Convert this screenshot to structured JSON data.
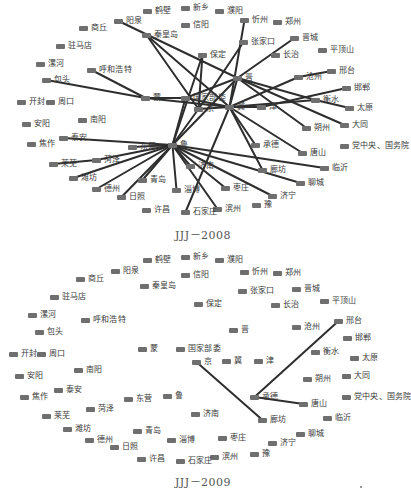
{
  "figures": [
    {
      "id": "2008",
      "caption": "JJJ－2008",
      "offset_y": 0,
      "nodes": [
        {
          "label": "鹤壁",
          "x": 143,
          "y": 11
        },
        {
          "label": "新乡",
          "x": 181,
          "y": 8
        },
        {
          "label": "濮阳",
          "x": 215,
          "y": 11
        },
        {
          "label": "忻州",
          "x": 240,
          "y": 20
        },
        {
          "label": "郑州",
          "x": 273,
          "y": 22
        },
        {
          "label": "阳泉",
          "x": 114,
          "y": 21
        },
        {
          "label": "信阳",
          "x": 181,
          "y": 25
        },
        {
          "label": "商丘",
          "x": 79,
          "y": 28
        },
        {
          "label": "秦皇岛",
          "x": 142,
          "y": 35
        },
        {
          "label": "张家口",
          "x": 239,
          "y": 42
        },
        {
          "label": "晋城",
          "x": 290,
          "y": 38
        },
        {
          "label": "驻马店",
          "x": 56,
          "y": 46
        },
        {
          "label": "保定",
          "x": 198,
          "y": 55
        },
        {
          "label": "长治",
          "x": 271,
          "y": 55
        },
        {
          "label": "平顶山",
          "x": 318,
          "y": 50
        },
        {
          "label": "漯河",
          "x": 36,
          "y": 64
        },
        {
          "label": "呼和浩特",
          "x": 87,
          "y": 70
        },
        {
          "label": "邢台",
          "x": 327,
          "y": 71
        },
        {
          "label": "晋",
          "x": 233,
          "y": 78
        },
        {
          "label": "沧州",
          "x": 294,
          "y": 77
        },
        {
          "label": "包头",
          "x": 42,
          "y": 80
        },
        {
          "label": "邯郸",
          "x": 342,
          "y": 88
        },
        {
          "label": "蒙",
          "x": 141,
          "y": 98
        },
        {
          "label": "国家部委",
          "x": 181,
          "y": 98
        },
        {
          "label": "衡水",
          "x": 311,
          "y": 100
        },
        {
          "label": "开封",
          "x": 17,
          "y": 102
        },
        {
          "label": "周口",
          "x": 46,
          "y": 102
        },
        {
          "label": "冀",
          "x": 225,
          "y": 107
        },
        {
          "label": "津",
          "x": 257,
          "y": 107
        },
        {
          "label": "太原",
          "x": 345,
          "y": 108
        },
        {
          "label": "京",
          "x": 194,
          "y": 109
        },
        {
          "label": "南阳",
          "x": 78,
          "y": 120
        },
        {
          "label": "安阳",
          "x": 22,
          "y": 124
        },
        {
          "label": "大同",
          "x": 340,
          "y": 125
        },
        {
          "label": "朔州",
          "x": 302,
          "y": 128
        },
        {
          "label": "泰安",
          "x": 59,
          "y": 138
        },
        {
          "label": "焦作",
          "x": 27,
          "y": 144
        },
        {
          "label": "鲁",
          "x": 168,
          "y": 145
        },
        {
          "label": "承德",
          "x": 251,
          "y": 145
        },
        {
          "label": "党中央、国务院",
          "x": 340,
          "y": 146
        },
        {
          "label": "东营",
          "x": 128,
          "y": 147
        },
        {
          "label": "唐山",
          "x": 298,
          "y": 153
        },
        {
          "label": "菏泽",
          "x": 92,
          "y": 160
        },
        {
          "label": "莱芜",
          "x": 49,
          "y": 164
        },
        {
          "label": "济南",
          "x": 186,
          "y": 166
        },
        {
          "label": "临沂",
          "x": 320,
          "y": 168
        },
        {
          "label": "廊坊",
          "x": 258,
          "y": 170
        },
        {
          "label": "潍坊",
          "x": 69,
          "y": 178
        },
        {
          "label": "青岛",
          "x": 138,
          "y": 180
        },
        {
          "label": "聊城",
          "x": 296,
          "y": 183
        },
        {
          "label": "枣庄",
          "x": 221,
          "y": 188
        },
        {
          "label": "德州",
          "x": 92,
          "y": 189
        },
        {
          "label": "淄博",
          "x": 172,
          "y": 190
        },
        {
          "label": "济宁",
          "x": 268,
          "y": 196
        },
        {
          "label": "日照",
          "x": 117,
          "y": 197
        },
        {
          "label": "豫",
          "x": 252,
          "y": 205
        },
        {
          "label": "滨州",
          "x": 213,
          "y": 209
        },
        {
          "label": "许昌",
          "x": 142,
          "y": 210
        },
        {
          "label": "石家庄",
          "x": 181,
          "y": 212
        }
      ],
      "edges": [
        [
          "阳泉",
          "晋"
        ],
        [
          "秦皇岛",
          "冀"
        ],
        [
          "秦皇岛",
          "京"
        ],
        [
          "呼和浩特",
          "蒙"
        ],
        [
          "包头",
          "蒙"
        ],
        [
          "蒙",
          "国家部委"
        ],
        [
          "蒙",
          "冀"
        ],
        [
          "忻州",
          "冀"
        ],
        [
          "张家口",
          "京"
        ],
        [
          "晋城",
          "晋"
        ],
        [
          "保定",
          "鲁"
        ],
        [
          "保定",
          "京"
        ],
        [
          "晋",
          "国家部委"
        ],
        [
          "晋",
          "冀"
        ],
        [
          "晋",
          "衡水"
        ],
        [
          "晋",
          "朔州"
        ],
        [
          "晋",
          "大同"
        ],
        [
          "晋",
          "鲁"
        ],
        [
          "沧州",
          "冀"
        ],
        [
          "邢台",
          "沧州"
        ],
        [
          "邯郸",
          "津"
        ],
        [
          "衡水",
          "太原"
        ],
        [
          "衡水",
          "冀"
        ],
        [
          "国家部委",
          "鲁"
        ],
        [
          "国家部委",
          "冀"
        ],
        [
          "京",
          "冀"
        ],
        [
          "京",
          "鲁"
        ],
        [
          "冀",
          "津"
        ],
        [
          "冀",
          "承德"
        ],
        [
          "冀",
          "唐山"
        ],
        [
          "冀",
          "廊坊"
        ],
        [
          "冀",
          "石家庄"
        ],
        [
          "泰安",
          "鲁"
        ],
        [
          "东营",
          "鲁"
        ],
        [
          "菏泽",
          "鲁"
        ],
        [
          "莱芜",
          "菏泽"
        ],
        [
          "潍坊",
          "鲁"
        ],
        [
          "德州",
          "鲁"
        ],
        [
          "日照",
          "鲁"
        ],
        [
          "青岛",
          "鲁"
        ],
        [
          "鲁",
          "淄博"
        ],
        [
          "鲁",
          "济南"
        ],
        [
          "鲁",
          "枣庄"
        ],
        [
          "鲁",
          "滨州"
        ],
        [
          "鲁",
          "济宁"
        ],
        [
          "鲁",
          "聊城"
        ],
        [
          "鲁",
          "临沂"
        ]
      ]
    },
    {
      "id": "2009",
      "caption": "JJJ－2009",
      "offset_y": 249,
      "nodes": [
        {
          "label": "鹤壁",
          "x": 143,
          "y": 11
        },
        {
          "label": "新乡",
          "x": 181,
          "y": 8
        },
        {
          "label": "濮阳",
          "x": 215,
          "y": 11
        },
        {
          "label": "忻州",
          "x": 240,
          "y": 23
        },
        {
          "label": "郑州",
          "x": 273,
          "y": 24
        },
        {
          "label": "阳泉",
          "x": 111,
          "y": 22
        },
        {
          "label": "信阳",
          "x": 181,
          "y": 26
        },
        {
          "label": "商丘",
          "x": 76,
          "y": 30
        },
        {
          "label": "秦皇岛",
          "x": 140,
          "y": 37
        },
        {
          "label": "张家口",
          "x": 238,
          "y": 42
        },
        {
          "label": "晋城",
          "x": 292,
          "y": 40
        },
        {
          "label": "驻马店",
          "x": 50,
          "y": 48
        },
        {
          "label": "保定",
          "x": 194,
          "y": 55
        },
        {
          "label": "长治",
          "x": 271,
          "y": 56
        },
        {
          "label": "平顶山",
          "x": 320,
          "y": 52
        },
        {
          "label": "漯河",
          "x": 28,
          "y": 66
        },
        {
          "label": "呼和浩特",
          "x": 81,
          "y": 71
        },
        {
          "label": "邢台",
          "x": 334,
          "y": 72
        },
        {
          "label": "晋",
          "x": 229,
          "y": 81
        },
        {
          "label": "沧州",
          "x": 292,
          "y": 78
        },
        {
          "label": "包头",
          "x": 35,
          "y": 83
        },
        {
          "label": "邯郸",
          "x": 343,
          "y": 89
        },
        {
          "label": "蒙",
          "x": 138,
          "y": 100
        },
        {
          "label": "国家部委",
          "x": 176,
          "y": 100
        },
        {
          "label": "衡水",
          "x": 311,
          "y": 103
        },
        {
          "label": "开封",
          "x": 9,
          "y": 105
        },
        {
          "label": "周口",
          "x": 37,
          "y": 105
        },
        {
          "label": "京",
          "x": 192,
          "y": 113
        },
        {
          "label": "冀",
          "x": 222,
          "y": 112
        },
        {
          "label": "津",
          "x": 254,
          "y": 112
        },
        {
          "label": "太原",
          "x": 350,
          "y": 109
        },
        {
          "label": "南阳",
          "x": 74,
          "y": 121
        },
        {
          "label": "安阳",
          "x": 15,
          "y": 127
        },
        {
          "label": "大同",
          "x": 342,
          "y": 127
        },
        {
          "label": "朔州",
          "x": 303,
          "y": 130
        },
        {
          "label": "泰安",
          "x": 54,
          "y": 141
        },
        {
          "label": "焦作",
          "x": 20,
          "y": 148
        },
        {
          "label": "鲁",
          "x": 163,
          "y": 147
        },
        {
          "label": "承德",
          "x": 250,
          "y": 148
        },
        {
          "label": "党中央、国务院",
          "x": 342,
          "y": 148
        },
        {
          "label": "东营",
          "x": 124,
          "y": 150
        },
        {
          "label": "唐山",
          "x": 299,
          "y": 155
        },
        {
          "label": "菏泽",
          "x": 86,
          "y": 160
        },
        {
          "label": "莱芜",
          "x": 42,
          "y": 167
        },
        {
          "label": "济南",
          "x": 191,
          "y": 165
        },
        {
          "label": "临沂",
          "x": 323,
          "y": 169
        },
        {
          "label": "廊坊",
          "x": 258,
          "y": 171
        },
        {
          "label": "潍坊",
          "x": 63,
          "y": 180
        },
        {
          "label": "青岛",
          "x": 133,
          "y": 182
        },
        {
          "label": "聊城",
          "x": 296,
          "y": 185
        },
        {
          "label": "枣庄",
          "x": 218,
          "y": 189
        },
        {
          "label": "德州",
          "x": 85,
          "y": 191
        },
        {
          "label": "淄博",
          "x": 167,
          "y": 191
        },
        {
          "label": "济宁",
          "x": 268,
          "y": 194
        },
        {
          "label": "日照",
          "x": 110,
          "y": 198
        },
        {
          "label": "豫",
          "x": 250,
          "y": 205
        },
        {
          "label": "滨州",
          "x": 210,
          "y": 208
        },
        {
          "label": "许昌",
          "x": 137,
          "y": 210
        },
        {
          "label": "石家庄",
          "x": 176,
          "y": 212
        }
      ],
      "edges": [
        [
          "邢台",
          "承德"
        ],
        [
          "承德",
          "唐山"
        ],
        [
          "京",
          "廊坊"
        ]
      ]
    }
  ],
  "stray_mark": {
    "x": 360,
    "y": 486
  }
}
